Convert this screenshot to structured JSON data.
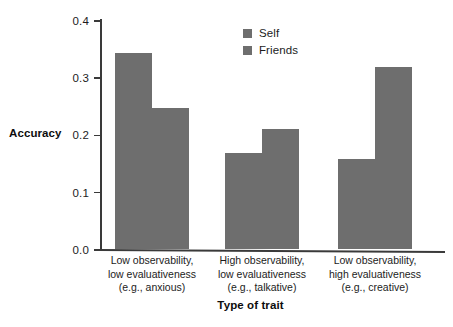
{
  "chart_data": {
    "type": "bar",
    "title": "",
    "xlabel": "Type of trait",
    "ylabel": "Accuracy",
    "ylim": [
      0.0,
      0.4
    ],
    "yticks": [
      "0.0",
      "0.1",
      "0.2",
      "0.3",
      "0.4"
    ],
    "ytick_values": [
      0.0,
      0.1,
      0.2,
      0.3,
      0.4
    ],
    "grid": false,
    "legend_position": "top-center",
    "bar_color": "#6e6e6e",
    "axis_color": "#3a3a3a",
    "categories": [
      "Low observability,\nlow evaluativeness\n(e.g., anxious)",
      "High observability,\nlow evaluativeness\n(e.g., talkative)",
      "Low observability,\nhigh evaluativeness\n(e.g., creative)"
    ],
    "category_lines": [
      [
        "Low observability,",
        "low evaluativeness",
        "(e.g., anxious)"
      ],
      [
        "High observability,",
        "low evaluativeness",
        "(e.g., talkative)"
      ],
      [
        "Low observability,",
        "high evaluativeness",
        "(e.g., creative)"
      ]
    ],
    "series": [
      {
        "name": "Self",
        "color": "#6e6e6e",
        "values": [
          0.342,
          0.167,
          0.158
        ]
      },
      {
        "name": "Friends",
        "color": "#6e6e6e",
        "values": [
          0.246,
          0.209,
          0.318
        ]
      }
    ]
  },
  "legend": {
    "items": [
      {
        "label": "Self"
      },
      {
        "label": "Friends"
      }
    ]
  }
}
